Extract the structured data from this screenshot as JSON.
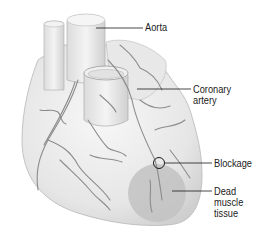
{
  "diagram": {
    "labels": {
      "aorta": "Aorta",
      "coronary_artery": "Coronary\nartery",
      "blockage": "Blockage",
      "dead_muscle_tissue": "Dead\nmuscle\ntissue"
    },
    "colors": {
      "background": "#ffffff",
      "heart_fill": "#ececec",
      "heart_shade": "#d6d6d6",
      "vessel": "#8a8a8a",
      "dead_tissue": "#bdbdbd",
      "leader_line": "#1a1a1a"
    }
  }
}
